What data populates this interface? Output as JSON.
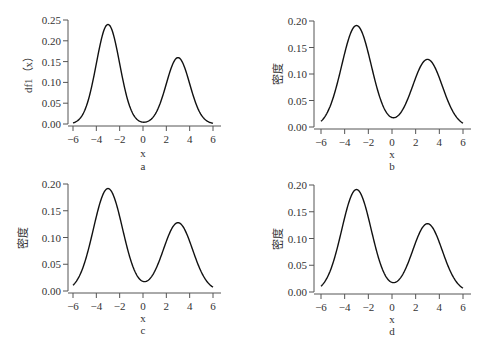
{
  "chart_data": [
    {
      "type": "line",
      "panel": "a",
      "title": "",
      "xlabel": "x",
      "ylabel": "df1（x）",
      "caption": "a",
      "xlim": [
        -6,
        6
      ],
      "ylim": [
        0,
        0.25
      ],
      "xticks": [
        "-6",
        "-4",
        "-2",
        "0",
        "2",
        "4",
        "6"
      ],
      "yticks": [
        "0.00",
        "0.05",
        "0.10",
        "0.15",
        "0.20",
        "0.25"
      ],
      "mixture": {
        "w1": 0.6,
        "mu1": -3,
        "sd1": 1,
        "w2": 0.4,
        "mu2": 3,
        "sd2": 1
      },
      "x": [
        -6,
        -5,
        -4,
        -3,
        -2,
        -1,
        0,
        1,
        2,
        3,
        4,
        5,
        6
      ],
      "values": [
        0.003,
        0.032,
        0.145,
        0.24,
        0.145,
        0.033,
        0.005,
        0.022,
        0.097,
        0.16,
        0.097,
        0.022,
        0.002
      ]
    },
    {
      "type": "line",
      "panel": "b",
      "title": "",
      "xlabel": "x",
      "ylabel": "密度",
      "caption": "b",
      "xlim": [
        -6,
        6
      ],
      "ylim": [
        0,
        0.2
      ],
      "xticks": [
        "-6",
        "-4",
        "-2",
        "0",
        "2",
        "4",
        "6"
      ],
      "yticks": [
        "0.00",
        "0.05",
        "0.10",
        "0.15",
        "0.20"
      ],
      "mixture": {
        "w1": 0.6,
        "mu1": -3,
        "sd1": 1.25,
        "w2": 0.4,
        "mu2": 3,
        "sd2": 1.25
      },
      "x": [
        -6,
        -5,
        -4,
        -3,
        -2,
        -1,
        0,
        1,
        2,
        3,
        4,
        5,
        6
      ],
      "values": [
        0.01,
        0.053,
        0.139,
        0.192,
        0.139,
        0.058,
        0.02,
        0.036,
        0.094,
        0.128,
        0.093,
        0.035,
        0.007
      ]
    },
    {
      "type": "line",
      "panel": "c",
      "title": "",
      "xlabel": "x",
      "ylabel": "密度",
      "caption": "c",
      "xlim": [
        -6,
        6
      ],
      "ylim": [
        0,
        0.2
      ],
      "xticks": [
        "-6",
        "-4",
        "-2",
        "0",
        "2",
        "4",
        "6"
      ],
      "yticks": [
        "0.00",
        "0.05",
        "0.10",
        "0.15",
        "0.20"
      ],
      "mixture": {
        "w1": 0.6,
        "mu1": -3,
        "sd1": 1.25,
        "w2": 0.4,
        "mu2": 3,
        "sd2": 1.25
      },
      "x": [
        -6,
        -5,
        -4,
        -3,
        -2,
        -1,
        0,
        1,
        2,
        3,
        4,
        5,
        6
      ],
      "values": [
        0.01,
        0.053,
        0.139,
        0.192,
        0.139,
        0.058,
        0.02,
        0.036,
        0.094,
        0.128,
        0.093,
        0.035,
        0.007
      ]
    },
    {
      "type": "line",
      "panel": "d",
      "title": "",
      "xlabel": "x",
      "ylabel": "密度",
      "caption": "d",
      "xlim": [
        -6,
        6
      ],
      "ylim": [
        0,
        0.2
      ],
      "xticks": [
        "-6",
        "-4",
        "-2",
        "0",
        "2",
        "4",
        "6"
      ],
      "yticks": [
        "0.00",
        "0.05",
        "0.10",
        "0.15",
        "0.20"
      ],
      "mixture": {
        "w1": 0.6,
        "mu1": -3,
        "sd1": 1.25,
        "w2": 0.4,
        "mu2": 3,
        "sd2": 1.25
      },
      "x": [
        -6,
        -5,
        -4,
        -3,
        -2,
        -1,
        0,
        1,
        2,
        3,
        4,
        5,
        6
      ],
      "values": [
        0.01,
        0.053,
        0.139,
        0.192,
        0.139,
        0.058,
        0.02,
        0.036,
        0.094,
        0.128,
        0.093,
        0.035,
        0.007
      ]
    }
  ],
  "layout": {
    "panels": [
      {
        "id": "a",
        "x0": 73,
        "x1": 213,
        "yaxisX": 68,
        "xaxisY": 126,
        "y0px": 124,
        "ymaxpx": 20,
        "xlabelY": 157,
        "captionY": 170,
        "ylabelX": 32
      },
      {
        "id": "b",
        "x0": 321,
        "x1": 463,
        "yaxisX": 314,
        "xaxisY": 129,
        "y0px": 127,
        "ymaxpx": 21,
        "xlabelY": 158,
        "captionY": 170,
        "ylabelX": 282
      },
      {
        "id": "c",
        "x0": 73,
        "x1": 213,
        "yaxisX": 68,
        "xaxisY": 293,
        "y0px": 291,
        "ymaxpx": 184,
        "xlabelY": 322,
        "captionY": 334,
        "ylabelX": 27
      },
      {
        "id": "d",
        "x0": 321,
        "x1": 463,
        "yaxisX": 314,
        "xaxisY": 294,
        "y0px": 292,
        "ymaxpx": 185,
        "xlabelY": 323,
        "captionY": 335,
        "ylabelX": 282
      }
    ]
  }
}
